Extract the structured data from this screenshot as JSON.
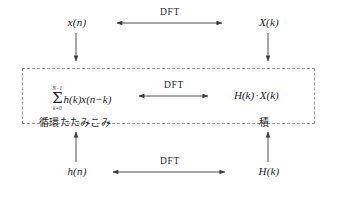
{
  "diagram": {
    "nodes": {
      "top_left": "x(n)",
      "top_right": "X(k)",
      "middle_right": "H(k) · X(k)",
      "bottom_left": "h(n)",
      "bottom_right": "H(k)"
    },
    "summation": {
      "upper_limit": "N−1",
      "lower_limit": "k=0",
      "sigma": "Σ",
      "body": "h(k)x(n−k)"
    },
    "product": {
      "left_factor": "H(k)",
      "operator": "·",
      "right_factor": "X(k)"
    },
    "arrow_labels": {
      "top": "DFT",
      "middle": "DFT",
      "bottom": "DFT"
    },
    "annotations": {
      "left": "循環たたみこみ",
      "right": "積"
    },
    "colors": {
      "stroke": "#3a3a3a",
      "dashed_border": "#9a9a9a",
      "text": "#232323",
      "background": "#ffffff"
    }
  }
}
